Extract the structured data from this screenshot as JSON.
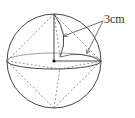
{
  "diagram": {
    "label": "3cm",
    "colors": {
      "stroke": "#333333",
      "dashed": "#666666",
      "background": "#ffffff"
    },
    "sphere": {
      "cx": 54,
      "cy": 61,
      "r": 47
    },
    "equator": {
      "cx": 54,
      "cy": 61,
      "rx": 47,
      "ry": 8
    },
    "center_point": {
      "x": 54,
      "y": 61
    },
    "radius_lines": [
      {
        "from": [
          54,
          61
        ],
        "to": [
          54,
          14
        ]
      },
      {
        "from": [
          54,
          61
        ],
        "to": [
          101,
          61
        ]
      }
    ],
    "arrows": [
      {
        "from": [
          104,
          21
        ],
        "to": [
          64,
          36
        ]
      },
      {
        "from": [
          104,
          21
        ],
        "to": [
          87,
          53
        ]
      }
    ]
  }
}
